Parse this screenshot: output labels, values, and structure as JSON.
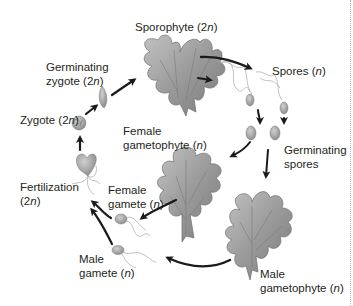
{
  "diagram": {
    "type": "life-cycle",
    "stages": [
      {
        "id": "sporophyte",
        "label_line1": "Sporophyte (2",
        "ploidy": "n",
        "suffix": ")"
      },
      {
        "id": "spores",
        "label_line1": "Spores (",
        "ploidy": "n",
        "suffix": ")"
      },
      {
        "id": "germinating_spores",
        "label_line1": "Germinating",
        "label_line2": "spores"
      },
      {
        "id": "male_gametophyte",
        "label_line1": "Male",
        "label_line2_pre": "gametophyte (",
        "ploidy": "n",
        "suffix": ")"
      },
      {
        "id": "female_gametophyte",
        "label_line1": "Female",
        "label_line2_pre": "gametophyte (",
        "ploidy": "n",
        "suffix": ")"
      },
      {
        "id": "male_gamete",
        "label_line1": "Male",
        "label_line2_pre": "gamete (",
        "ploidy": "n",
        "suffix": ")"
      },
      {
        "id": "female_gamete",
        "label_line1": "Female",
        "label_line2_pre": "gamete (",
        "ploidy": "n",
        "suffix": ")"
      },
      {
        "id": "fertilization",
        "label_line1": "Fertilization",
        "label_line2_pre": "(2",
        "ploidy": "n",
        "suffix": ")"
      },
      {
        "id": "zygote",
        "label_line1": "Zygote (2",
        "ploidy": "n",
        "suffix": ")"
      },
      {
        "id": "germinating_zygote",
        "label_line1": "Germinating",
        "label_line2_pre": "zygote (2",
        "ploidy": "n",
        "suffix": ")"
      }
    ],
    "flow": [
      "Germinating zygote (2n) -> Sporophyte (2n)",
      "Sporophyte (2n) -> Spores (n)",
      "Spores (n) -> Germinating spores",
      "Germinating spores -> Female gametophyte (n)",
      "Germinating spores -> Male gametophyte (n)",
      "Female gametophyte (n) -> Female gamete (n)",
      "Male gametophyte (n) -> Male gamete (n)",
      "Female gamete (n) -> Fertilization (2n)",
      "Male gamete (n) -> Fertilization (2n)",
      "Fertilization (2n) -> Zygote (2n)",
      "Zygote (2n) -> Germinating zygote (2n)"
    ],
    "colors": {
      "text": "#231f20",
      "arrow": "#1a1a1a",
      "thallus_fill": "#9a9a9a",
      "thallus_dark": "#6e6e6e",
      "thallus_light": "#c4c4c4",
      "cell_fill": "#a8a8a8",
      "flagella": "#b0b0b0",
      "background": "#ffffff",
      "page_edge": "#b5b5b5"
    }
  }
}
